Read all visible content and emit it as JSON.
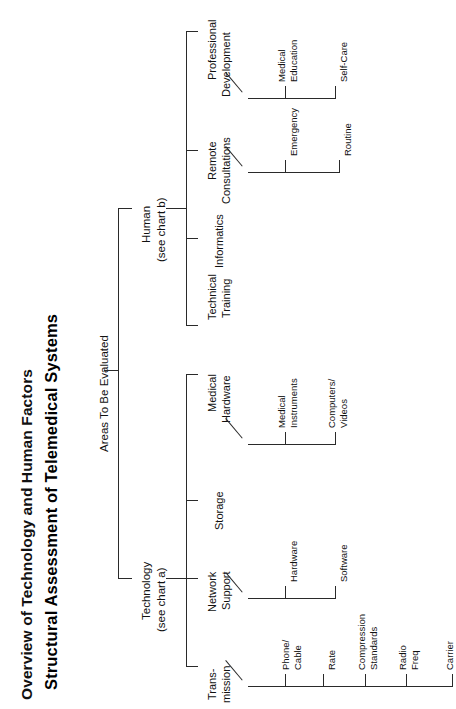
{
  "document": {
    "clipped_heading": "Overview of Technology and Human Factors",
    "title": "Structural Assessment of Telemedical Systems"
  },
  "tree": {
    "root": {
      "label": "Areas To Be Evaluated"
    },
    "branches": [
      {
        "label_line1": "Technology",
        "label_line2": "(see chart a)",
        "children": [
          {
            "label_line1": "Trans-",
            "label_line2": "mission",
            "leaves": [
              {
                "line1": "Phone/",
                "line2": "Cable"
              },
              {
                "line1": "Rate",
                "line2": ""
              },
              {
                "line1": "Compression",
                "line2": "Standards"
              },
              {
                "line1": "Radio",
                "line2": "Freq"
              },
              {
                "line1": "Carrier",
                "line2": ""
              }
            ]
          },
          {
            "label_line1": "Network",
            "label_line2": "Support",
            "leaves": [
              {
                "line1": "Hardware",
                "line2": ""
              },
              {
                "line1": "Software",
                "line2": ""
              }
            ]
          },
          {
            "label_line1": "Storage",
            "label_line2": "",
            "leaves": []
          },
          {
            "label_line1": "Medical",
            "label_line2": "Hardware",
            "leaves": [
              {
                "line1": "Medical",
                "line2": "Instruments"
              },
              {
                "line1": "Computers/",
                "line2": "Videos"
              }
            ]
          }
        ]
      },
      {
        "label_line1": "Human",
        "label_line2": "(see chart b)",
        "children": [
          {
            "label_line1": "Technical",
            "label_line2": "Training",
            "leaves": []
          },
          {
            "label_line1": "Informatics",
            "label_line2": "",
            "leaves": []
          },
          {
            "label_line1": "Remote",
            "label_line2": "Consultations",
            "leaves": [
              {
                "line1": "Emergency",
                "line2": ""
              },
              {
                "line1": "Routine",
                "line2": ""
              }
            ]
          },
          {
            "label_line1": "Professional",
            "label_line2": "Development",
            "leaves": [
              {
                "line1": "Medical",
                "line2": "Education"
              },
              {
                "line1": "Self-Care",
                "line2": ""
              }
            ]
          }
        ]
      }
    ]
  },
  "style": {
    "line_color": "#2a2a2a",
    "text_color": "#111111",
    "background": "#ffffff"
  }
}
